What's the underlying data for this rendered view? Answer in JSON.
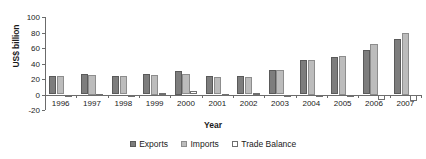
{
  "chart_data": {
    "type": "bar",
    "title": "",
    "xlabel": "Year",
    "ylabel": "US$ billion",
    "categories": [
      "1996",
      "1997",
      "1998",
      "1999",
      "2000",
      "2001",
      "2002",
      "2003",
      "2004",
      "2005",
      "2006",
      "2007"
    ],
    "series": [
      {
        "name": "Exports",
        "values": [
          24,
          26,
          24,
          27,
          30,
          24,
          24,
          31,
          44,
          48,
          58,
          71
        ]
      },
      {
        "name": "Imports",
        "values": [
          24,
          25,
          24,
          25,
          26,
          23,
          22,
          31,
          45,
          50,
          65,
          80
        ]
      },
      {
        "name": "Trade Balance",
        "values": [
          0,
          1,
          0,
          2,
          4,
          1,
          2,
          0,
          -1,
          -2,
          -7,
          -9
        ]
      }
    ],
    "ylim": [
      -20,
      100
    ],
    "yticks": [
      -20,
      0,
      20,
      40,
      60,
      80,
      100
    ],
    "ytick_labels": [
      "-20",
      "0",
      "20",
      "40",
      "60",
      "80",
      "100"
    ],
    "grid": false,
    "legend_position": "bottom",
    "colors": {
      "exports": "#7d7d7d",
      "imports": "#bcbcbc",
      "balance": "#ffffff",
      "axis": "#6b6b6b",
      "text": "#1a1a1a"
    }
  },
  "legend": {
    "items": [
      {
        "label": "Exports",
        "key": "exports"
      },
      {
        "label": "Imports",
        "key": "imports"
      },
      {
        "label": "Trade Balance",
        "key": "balance"
      }
    ]
  }
}
